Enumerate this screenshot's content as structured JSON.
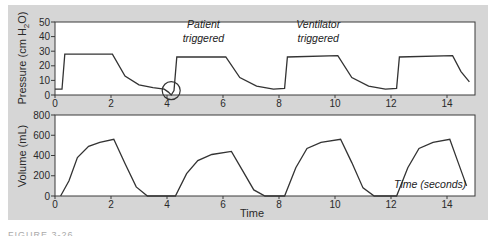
{
  "chart_data": [
    {
      "type": "line",
      "title": "",
      "xlabel": "",
      "ylabel": "Pressure (cm H2O)",
      "ylabel_parts": {
        "main": "Pressure (cm H",
        "sub": "2",
        "tail": "O)"
      },
      "xlim": [
        0,
        15
      ],
      "ylim": [
        0,
        50
      ],
      "x_ticks": [
        "0",
        "2",
        "4",
        "6",
        "8",
        "10",
        "12",
        "14"
      ],
      "y_ticks": [
        "0",
        "10",
        "20",
        "30",
        "40",
        "50"
      ],
      "grid": false,
      "series": [
        {
          "name": "Pressure",
          "x": [
            0,
            0.25,
            0.35,
            2.05,
            2.5,
            3.0,
            3.5,
            3.9,
            4.05,
            4.15,
            4.25,
            4.35,
            6.1,
            6.6,
            7.2,
            7.8,
            8.2,
            8.3,
            10.1,
            10.6,
            11.2,
            11.8,
            12.2,
            12.3,
            14.2,
            14.5,
            14.8
          ],
          "y": [
            4,
            4,
            28,
            28,
            13,
            7,
            5,
            4,
            2,
            0,
            3,
            26,
            26,
            12,
            6,
            4,
            4.5,
            26,
            27,
            12,
            6,
            4,
            4.5,
            26,
            27,
            16,
            9
          ]
        }
      ],
      "annotations": [
        {
          "text": "Patient",
          "x": 5.3,
          "y": 46
        },
        {
          "text": "triggered",
          "x": 5.3,
          "y": 36
        },
        {
          "text": "Ventilator",
          "x": 9.4,
          "y": 46
        },
        {
          "text": "triggered",
          "x": 9.4,
          "y": 36
        },
        {
          "type": "circle",
          "x": 4.15,
          "y": 3,
          "note": "patient trigger dip"
        }
      ]
    },
    {
      "type": "line",
      "title": "",
      "xlabel": "Time",
      "ylabel": "Volume (mL)",
      "xlim": [
        0,
        15
      ],
      "ylim": [
        0,
        800
      ],
      "x_ticks": [
        "0",
        "2",
        "4",
        "6",
        "8",
        "10",
        "12",
        "14"
      ],
      "y_ticks": [
        "0",
        "200",
        "400",
        "600",
        "800"
      ],
      "grid": false,
      "series": [
        {
          "name": "Volume",
          "x": [
            0.2,
            0.5,
            0.8,
            1.2,
            1.6,
            2.1,
            2.5,
            2.9,
            3.3,
            4.3,
            4.7,
            5.1,
            5.6,
            6.3,
            6.7,
            7.1,
            7.5,
            8.2,
            8.6,
            9.0,
            9.5,
            10.2,
            10.6,
            11.0,
            11.4,
            12.2,
            12.6,
            13.0,
            13.5,
            14.1,
            14.4,
            14.7
          ],
          "y": [
            0,
            150,
            380,
            490,
            530,
            560,
            320,
            90,
            0,
            0,
            220,
            350,
            410,
            440,
            250,
            60,
            0,
            0,
            280,
            470,
            530,
            560,
            330,
            80,
            0,
            0,
            280,
            470,
            530,
            560,
            330,
            100
          ]
        }
      ],
      "annotations": [
        {
          "text": "Time (seconds)",
          "x": 13.4,
          "y": 80
        }
      ]
    }
  ],
  "figure": {
    "caption": "FIGURE 3-26"
  }
}
